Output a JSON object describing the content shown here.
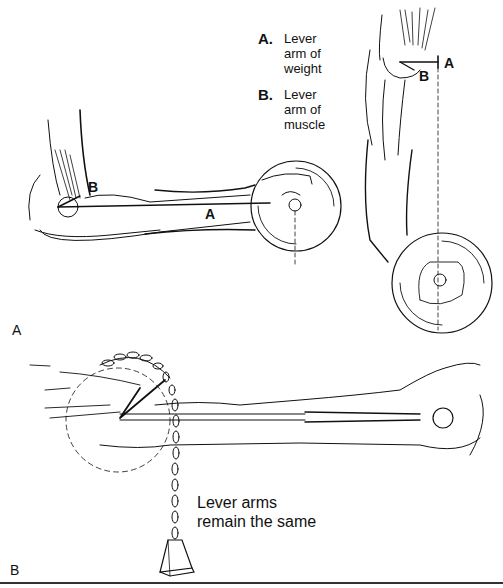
{
  "figure": {
    "legend": [
      {
        "key": "A.",
        "text_lines": [
          "Lever",
          "arm of",
          "weight"
        ]
      },
      {
        "key": "B.",
        "text_lines": [
          "Lever",
          "arm of",
          "muscle"
        ]
      }
    ],
    "panel_labels": {
      "a": "A",
      "b": "B"
    },
    "arm_labels": {
      "left_a": "A",
      "left_b": "B",
      "right_a": "A",
      "right_b": "B"
    },
    "callout_lines": [
      "Lever arms",
      "remain the same"
    ],
    "colors": {
      "ink": "#111111",
      "background": "#ffffff"
    }
  }
}
